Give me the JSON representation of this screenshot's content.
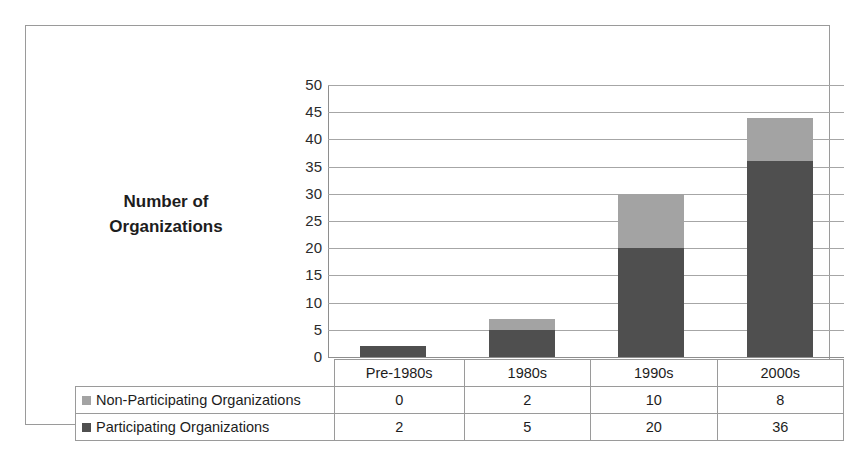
{
  "chart_data": {
    "type": "bar",
    "subtype": "stacked-column",
    "title": "",
    "xlabel": "",
    "ylabel": "Number of Organizations",
    "ylabel_lines": [
      "Number of",
      "Organizations"
    ],
    "categories": [
      "Pre-1980s",
      "1980s",
      "1990s",
      "2000s"
    ],
    "series": [
      {
        "name": "Non-Participating Organizations",
        "values": [
          0,
          2,
          10,
          8
        ],
        "color": "#a3a3a3",
        "stack_order": 2
      },
      {
        "name": "Participating Organizations",
        "values": [
          2,
          5,
          20,
          36
        ],
        "color": "#4f4f4f",
        "stack_order": 1
      }
    ],
    "totals": [
      2,
      7,
      30,
      44
    ],
    "ylim": [
      0,
      50
    ],
    "ytick_step": 5,
    "ytick_labels": [
      "50",
      "45",
      "40",
      "35",
      "30",
      "25",
      "20",
      "15",
      "10",
      "5",
      "0"
    ],
    "grid": true,
    "legend_position": "data-table-left",
    "data_table_visible": true
  },
  "colors": {
    "participating": "#4f4f4f",
    "non_participating": "#a3a3a3",
    "gridline": "#a6a6a6",
    "axis": "#8e8e8e",
    "frame_border": "#9a9a9a",
    "text": "#1d1d1d",
    "background": "#ffffff"
  },
  "table": {
    "blank_header_label": "",
    "category_headers": [
      "Pre-1980s",
      "1980s",
      "1990s",
      "2000s"
    ],
    "rows": [
      {
        "label": "Non-Participating Organizations",
        "swatch": "non-participating-swatch",
        "values": [
          "0",
          "2",
          "10",
          "8"
        ]
      },
      {
        "label": "Participating Organizations",
        "swatch": "participating-swatch",
        "values": [
          "2",
          "5",
          "20",
          "36"
        ]
      }
    ]
  }
}
